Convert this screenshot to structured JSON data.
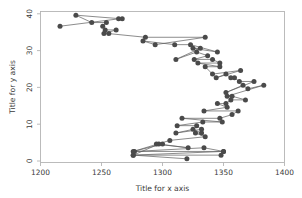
{
  "chart_data": {
    "type": "line",
    "title": "",
    "subtitle": "",
    "xlabel": "Title for x axis",
    "ylabel": "Title for y axis",
    "xlim": [
      1200,
      1400
    ],
    "ylim": [
      0,
      41
    ],
    "xticks": [
      1200,
      1250,
      1300,
      1350,
      1400
    ],
    "yticks": [
      0,
      10,
      20,
      30,
      40
    ],
    "xtick_labels": [
      "1200",
      "1250",
      "1300",
      "1350",
      "1400"
    ],
    "ytick_labels": [
      "0",
      "10",
      "20",
      "30",
      "40"
    ],
    "grid": false,
    "legend": null,
    "legend_position": "none",
    "marker": "circle",
    "marker_color": "#4a4a4a",
    "line_color": "#5a5a5a",
    "frame_color": "#b4b4b4",
    "background_color": "#ffffff",
    "orientation": "vertical-series",
    "series": [
      {
        "name": "series-1",
        "x": [
          1320,
          1276,
          1348,
          1350,
          1277,
          1334,
          1350,
          1276,
          1297,
          1321,
          1295,
          1300,
          1276,
          1306,
          1335,
          1327,
          1332,
          1325,
          1311,
          1332,
          1328,
          1312,
          1333,
          1349,
          1316,
          1347,
          1357,
          1362,
          1334,
          1353,
          1345,
          1352,
          1356,
          1368,
          1357,
          1353,
          1383,
          1370,
          1366,
          1352,
          1375,
          1363,
          1359,
          1356,
          1352,
          1344,
          1364,
          1341,
          1335,
          1347,
          1329,
          1347,
          1341,
          1326,
          1337,
          1328,
          1311,
          1331,
          1325,
          1345,
          1323,
          1310,
          1284,
          1294,
          1335,
          1286,
          1256,
          1252,
          1262,
          1253,
          1251,
          1254,
          1242,
          1229,
          1267,
          1264,
          1216
        ],
        "y": [
          1,
          2,
          2,
          3,
          3,
          4,
          3,
          2,
          5,
          4,
          5,
          5,
          3,
          6,
          7,
          8,
          8,
          9,
          8,
          9,
          10,
          10,
          11,
          11,
          12,
          12,
          13,
          14,
          14,
          15,
          16,
          16,
          17,
          17,
          18,
          18,
          21,
          20,
          21,
          19,
          22,
          22,
          23,
          23,
          24,
          23,
          25,
          24,
          26,
          26,
          27,
          27,
          28,
          28,
          29,
          30,
          28,
          31,
          31,
          30,
          32,
          32,
          33,
          32,
          34,
          34,
          35,
          35,
          36,
          36,
          37,
          38,
          38,
          40,
          39,
          39,
          37
        ]
      }
    ]
  },
  "axes": {
    "x_title": "Title for x axis",
    "y_title": "Title for y axis"
  }
}
